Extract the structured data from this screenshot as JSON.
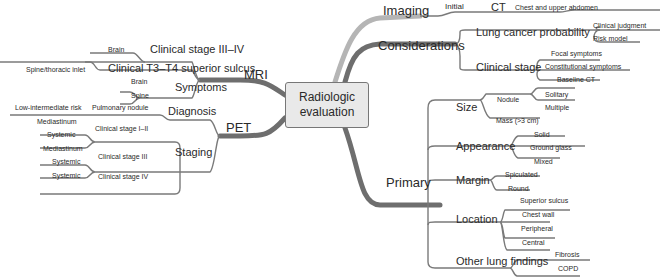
{
  "center": {
    "line1": "Radiologic",
    "line2": "evaluation"
  },
  "colors": {
    "imaging_branch": "#b5b5b5",
    "main_branch": "#6e6e6e",
    "line": "#7a7a7a",
    "center_fill": "#e9e9e9"
  },
  "right": {
    "imaging": {
      "label": "Imaging",
      "initial": "Initial",
      "ct": "CT",
      "ct_detail": "Chest and upper abdomen"
    },
    "considerations": {
      "label": "Considerations",
      "lung_cancer_probability": {
        "label": "Lung cancer probability",
        "items": [
          "Clinical judgment",
          "Risk model"
        ]
      },
      "clinical_stage": {
        "label": "Clinical stage",
        "items": [
          "Focal symptoms",
          "Constitutional symptoms",
          "Baseline CT"
        ]
      }
    },
    "primary": {
      "label": "Primary",
      "size": {
        "label": "Size",
        "nodule": "Nodule",
        "nodule_items": [
          "Solitary",
          "Multiple"
        ],
        "mass": "Mass (>3 cm)"
      },
      "appearance": {
        "label": "Appearance",
        "items": [
          "Solid",
          "Ground glass",
          "Mixed"
        ]
      },
      "margin": {
        "label": "Margin",
        "items": [
          "Spiculated",
          "Round"
        ]
      },
      "location": {
        "label": "Location",
        "items": [
          "Superior sulcus",
          "Chest wall",
          "Peripheral",
          "Central"
        ]
      },
      "other": {
        "label": "Other lung findings",
        "items": [
          "Fibrosis",
          "COPD"
        ]
      }
    }
  },
  "left": {
    "mri": {
      "label": "MRI",
      "stage34": {
        "label": "Clinical stage III–IV",
        "item": "Brain"
      },
      "t3t4": {
        "label": "Clinical T3–T4 superior sulcus",
        "item": "Spine/thoracic inlet"
      },
      "symptoms": {
        "label": "Symptoms",
        "items": [
          "Brain",
          "Spine"
        ]
      }
    },
    "pet": {
      "label": "PET",
      "diagnosis": {
        "label": "Diagnosis",
        "nodule": "Pulmonary nodule",
        "risk": "Low-intermediate risk"
      },
      "staging": {
        "label": "Staging",
        "stage12": {
          "label": "Clinical stage I–II",
          "items": [
            "Mediastinum",
            "Systemic"
          ]
        },
        "stage3": {
          "label": "Clinical stage III",
          "items": [
            "Mediastinum",
            "Systemic"
          ]
        },
        "stage4": {
          "label": "Clinical stage IV",
          "items": [
            "Systemic"
          ]
        }
      }
    }
  }
}
